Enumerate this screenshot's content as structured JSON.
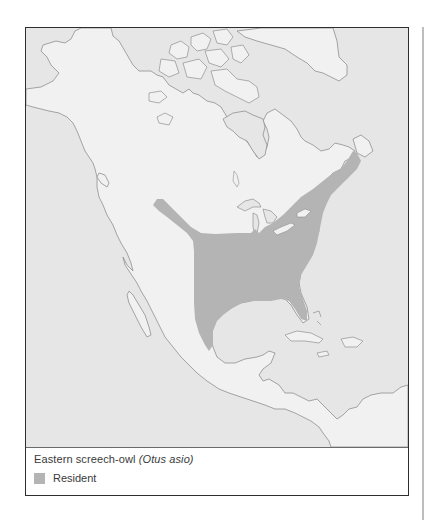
{
  "map": {
    "region": "North America",
    "colors": {
      "water": "#e6e6e6",
      "land": "#f1f1f1",
      "coastline": "#8f8f8f",
      "range_resident": "#b4b4b4",
      "frame": "#2e2e2e"
    }
  },
  "legend": {
    "species_common": "Eastern screech-owl",
    "species_scientific": "(Otus asio)",
    "items": [
      {
        "label": "Resident",
        "color": "#b4b4b4"
      }
    ]
  }
}
